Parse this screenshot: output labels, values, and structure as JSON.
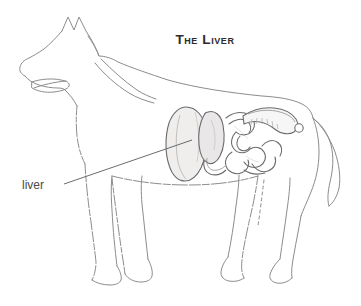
{
  "figure": {
    "title": "The Liver",
    "title_style": "small-caps",
    "background_color": "#ffffff"
  },
  "labels": [
    {
      "id": "liver",
      "text": "liver",
      "text_x": 22,
      "text_y": 189,
      "leader_from_x": 64,
      "leader_from_y": 184,
      "leader_to_x": 192,
      "leader_to_y": 140,
      "color": "#4a4a4a"
    }
  ],
  "organs": [
    {
      "name": "liver",
      "fill": "#f0efee",
      "stroke": "#6e6e70",
      "highlighted": true
    },
    {
      "name": "stomach",
      "fill": "#eceaea",
      "stroke": "#6e6e70",
      "highlighted": false
    },
    {
      "name": "small-intestine",
      "fill": "#f6f5f5",
      "stroke": "#6e6e70",
      "highlighted": false
    },
    {
      "name": "large-intestine-colon",
      "fill": "#f6f5f5",
      "stroke": "#6e6e70",
      "highlighted": false
    },
    {
      "name": "rectum-terminus",
      "fill": "#ffffff",
      "stroke": "#6e6e70",
      "highlighted": false
    }
  ],
  "style": {
    "outline_stroke": "#8c8c90",
    "organ_stroke": "#6b6b6d",
    "leader_stroke": "#5a5a5a",
    "title_color": "#2b2b2b",
    "label_color": "#4a4a4a",
    "outline_width": 1,
    "organ_width": 1
  }
}
